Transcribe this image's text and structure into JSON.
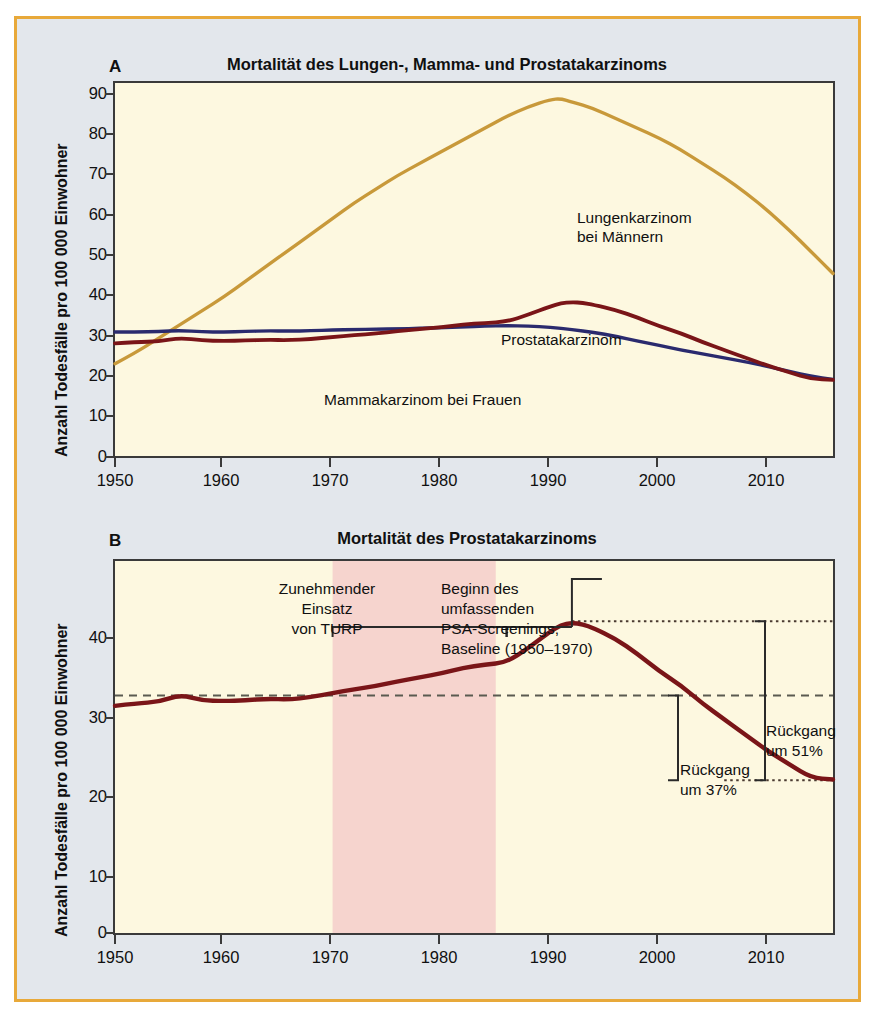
{
  "figure": {
    "border_color": "#e8a93a",
    "background_color": "#e3e7ec",
    "plot_background_color": "#fdf8e0"
  },
  "panel_a": {
    "letter": "A",
    "title": "Mortalität des Lungen-, Mamma- und Prostatakarzinoms",
    "ylabel": "Anzahl Todesfälle pro 100 000 Einwohner",
    "yticks": [
      "0",
      "10",
      "20",
      "30",
      "40",
      "50",
      "60",
      "70",
      "80",
      "90"
    ],
    "xticks": [
      "1950",
      "1960",
      "1970",
      "1980",
      "1990",
      "2000",
      "2010"
    ],
    "annotations": {
      "lung_line1": "Lungenkarzinom",
      "lung_line2": "bei Männern",
      "prostate": "Prostatakarzinom",
      "breast": "Mammakarzinom bei Frauen"
    }
  },
  "panel_b": {
    "letter": "B",
    "title": "Mortalität des Prostatakarzinoms",
    "ylabel": "Anzahl Todesfälle pro 100 000 Einwohner",
    "yticks": [
      "0",
      "10",
      "20",
      "30",
      "40"
    ],
    "xticks": [
      "1950",
      "1960",
      "1970",
      "1980",
      "1990",
      "2000",
      "2010"
    ],
    "annotations": {
      "turp_line1": "Zunehmender",
      "turp_line2": "Einsatz",
      "turp_line3": "von TURP",
      "psa_line1": "Beginn des",
      "psa_line2": "umfassenden",
      "psa_line3": "PSA-Screenings,",
      "psa_line4": "Baseline (1950–1970)",
      "decline51_line1": "Rückgang",
      "decline51_line2": "um 51%",
      "decline37_line1": "Rückgang",
      "decline37_line2": "um 37%"
    }
  },
  "chart_data": [
    {
      "id": "panel-a",
      "type": "line",
      "title": "Mortalität des Lungen-, Mamma- und Prostatakarzinoms",
      "xlabel": "",
      "ylabel": "Anzahl Todesfälle pro 100 000 Einwohner",
      "xlim": [
        1950,
        2016
      ],
      "ylim": [
        0,
        95
      ],
      "xticks": [
        1950,
        1960,
        1970,
        1980,
        1990,
        2000,
        2010
      ],
      "yticks": [
        0,
        10,
        20,
        30,
        40,
        50,
        60,
        70,
        80,
        90
      ],
      "grid": false,
      "legend": "inline-annotations",
      "series": [
        {
          "name": "Lungenkarzinom bei Männern",
          "color": "#c8993a",
          "x": [
            1950,
            1952,
            1954,
            1956,
            1958,
            1960,
            1962,
            1964,
            1966,
            1968,
            1970,
            1972,
            1974,
            1976,
            1978,
            1980,
            1982,
            1984,
            1986,
            1988,
            1990,
            1991,
            1992,
            1994,
            1996,
            1998,
            2000,
            2002,
            2004,
            2006,
            2008,
            2010,
            2012,
            2014,
            2016
          ],
          "y": [
            23.5,
            26.5,
            30.0,
            33.5,
            37.0,
            40.5,
            44.5,
            48.5,
            52.5,
            56.5,
            60.5,
            64.5,
            68.0,
            71.5,
            74.5,
            77.5,
            80.5,
            83.5,
            86.5,
            89.0,
            90.8,
            91.0,
            90.2,
            88.5,
            86.0,
            83.5,
            81.0,
            78.0,
            74.5,
            71.0,
            67.0,
            62.5,
            57.5,
            52.0,
            46.5
          ]
        },
        {
          "name": "Prostatakarzinom",
          "color": "#7a1518",
          "x": [
            1950,
            1952,
            1954,
            1956,
            1958,
            1960,
            1962,
            1964,
            1966,
            1968,
            1970,
            1972,
            1974,
            1976,
            1978,
            1980,
            1982,
            1984,
            1986,
            1988,
            1990,
            1991,
            1992,
            1993,
            1994,
            1996,
            1998,
            2000,
            2002,
            2004,
            2006,
            2008,
            2010,
            2012,
            2014,
            2016
          ],
          "y": [
            28.7,
            29.0,
            29.2,
            30.1,
            29.4,
            29.3,
            29.4,
            29.6,
            29.5,
            29.8,
            30.3,
            30.8,
            31.2,
            31.8,
            32.3,
            32.8,
            33.5,
            33.9,
            34.2,
            36.0,
            38.1,
            38.9,
            39.2,
            39.0,
            38.5,
            37.2,
            35.3,
            33.1,
            31.3,
            29.0,
            27.0,
            25.0,
            23.0,
            21.3,
            19.6,
            19.4
          ]
        },
        {
          "name": "Mammakarzinom bei Frauen",
          "color": "#2a2a6e",
          "x": [
            1950,
            1952,
            1954,
            1956,
            1958,
            1960,
            1962,
            1964,
            1966,
            1968,
            1970,
            1972,
            1974,
            1976,
            1978,
            1980,
            1982,
            1984,
            1986,
            1988,
            1990,
            1992,
            1994,
            1996,
            1998,
            2000,
            2002,
            2004,
            2006,
            2008,
            2010,
            2012,
            2014,
            2016
          ],
          "y": [
            31.6,
            31.6,
            31.7,
            32.0,
            31.6,
            31.6,
            31.7,
            31.9,
            31.8,
            31.9,
            32.1,
            32.2,
            32.3,
            32.4,
            32.5,
            32.7,
            32.9,
            33.1,
            33.2,
            33.1,
            32.8,
            32.2,
            31.5,
            30.5,
            29.3,
            28.2,
            27.0,
            26.0,
            25.0,
            24.0,
            22.8,
            21.5,
            20.3,
            19.5
          ]
        }
      ]
    },
    {
      "id": "panel-b",
      "type": "line",
      "title": "Mortalität des Prostatakarzinoms",
      "xlabel": "",
      "ylabel": "Anzahl Todesfälle pro 100 000 Einwohner",
      "xlim": [
        1950,
        2016
      ],
      "ylim": [
        0,
        47
      ],
      "xticks": [
        1950,
        1960,
        1970,
        1980,
        1990,
        2000,
        2010
      ],
      "yticks": [
        0,
        10,
        20,
        30,
        40
      ],
      "grid": false,
      "series": [
        {
          "name": "Prostatakarzinom",
          "color": "#7a1518",
          "x": [
            1950,
            1952,
            1954,
            1956,
            1958,
            1960,
            1962,
            1964,
            1966,
            1968,
            1970,
            1972,
            1974,
            1976,
            1978,
            1980,
            1982,
            1984,
            1986,
            1988,
            1990,
            1991,
            1992,
            1993,
            1994,
            1996,
            1998,
            2000,
            2002,
            2004,
            2006,
            2008,
            2010,
            2012,
            2014,
            2016
          ],
          "y": [
            28.7,
            29.0,
            29.2,
            30.1,
            29.4,
            29.3,
            29.4,
            29.6,
            29.5,
            29.8,
            30.3,
            30.8,
            31.2,
            31.8,
            32.3,
            32.8,
            33.5,
            33.9,
            34.2,
            36.0,
            38.1,
            38.9,
            39.2,
            39.0,
            38.5,
            37.2,
            35.3,
            33.1,
            31.3,
            29.0,
            27.0,
            25.0,
            23.0,
            21.3,
            19.6,
            19.4
          ]
        }
      ],
      "reference_lines": [
        {
          "name": "peak-dotted",
          "y": 39.4,
          "x_from": 1992,
          "x_to": 2016,
          "style": "dotted"
        },
        {
          "name": "baseline-dashed",
          "y": 30.0,
          "x_from": 1950,
          "x_to": 2016,
          "style": "dashed"
        },
        {
          "name": "floor-dotted",
          "y": 19.3,
          "x_from": 2006,
          "x_to": 2016,
          "style": "dotted"
        }
      ],
      "shaded_regions": [
        {
          "name": "turp-era",
          "x_from": 1970,
          "x_to": 1985,
          "color": "#f6d4ce",
          "label": "Zunehmender Einsatz von TURP"
        }
      ],
      "brackets": [
        {
          "name": "turp-bracket",
          "x_from": 1970,
          "x_to": 1986,
          "label": "Zunehmender Einsatz von TURP"
        },
        {
          "name": "psa-bracket",
          "x_from": 1986,
          "x_to": 1992,
          "label": "Beginn des umfassenden PSA-Screenings, Baseline (1950–1970)"
        },
        {
          "name": "decline-51-bracket",
          "y_from": 19.3,
          "y_to": 39.4,
          "label": "Rückgang um 51%"
        },
        {
          "name": "decline-37-bracket",
          "y_from": 19.3,
          "y_to": 30.0,
          "label": "Rückgang um 37%"
        }
      ]
    }
  ]
}
